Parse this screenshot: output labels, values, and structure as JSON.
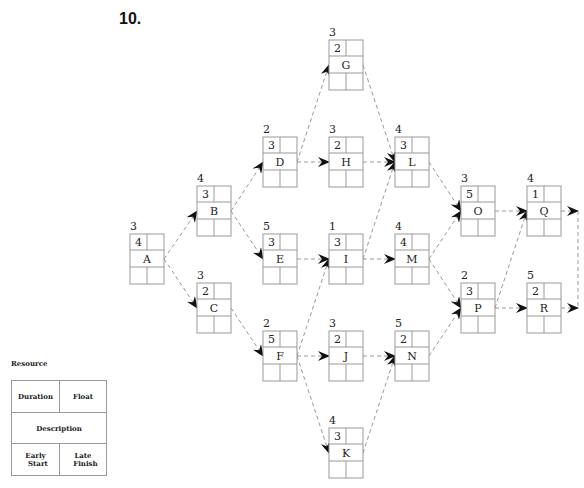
{
  "problem_number": "10.",
  "legend": {
    "title": "Resource",
    "duration": "Duration",
    "float": "Float",
    "description": "Description",
    "early_start": [
      "Early",
      "Start"
    ],
    "late_finish": [
      "Late",
      "Finish"
    ]
  },
  "activities": [
    {
      "id": "A",
      "resource": "3",
      "duration": "4",
      "float": "",
      "early_start": "",
      "late_finish": ""
    },
    {
      "id": "B",
      "resource": "4",
      "duration": "3",
      "float": "",
      "early_start": "",
      "late_finish": ""
    },
    {
      "id": "C",
      "resource": "3",
      "duration": "2",
      "float": "",
      "early_start": "",
      "late_finish": ""
    },
    {
      "id": "D",
      "resource": "2",
      "duration": "3",
      "float": "",
      "early_start": "",
      "late_finish": ""
    },
    {
      "id": "E",
      "resource": "5",
      "duration": "3",
      "float": "",
      "early_start": "",
      "late_finish": ""
    },
    {
      "id": "F",
      "resource": "2",
      "duration": "5",
      "float": "",
      "early_start": "",
      "late_finish": ""
    },
    {
      "id": "G",
      "resource": "3",
      "duration": "2",
      "float": "",
      "early_start": "",
      "late_finish": ""
    },
    {
      "id": "H",
      "resource": "3",
      "duration": "2",
      "float": "",
      "early_start": "",
      "late_finish": ""
    },
    {
      "id": "I",
      "resource": "1",
      "duration": "3",
      "float": "",
      "early_start": "",
      "late_finish": ""
    },
    {
      "id": "J",
      "resource": "3",
      "duration": "2",
      "float": "",
      "early_start": "",
      "late_finish": ""
    },
    {
      "id": "K",
      "resource": "4",
      "duration": "3",
      "float": "",
      "early_start": "",
      "late_finish": ""
    },
    {
      "id": "L",
      "resource": "4",
      "duration": "3",
      "float": "",
      "early_start": "",
      "late_finish": ""
    },
    {
      "id": "M",
      "resource": "4",
      "duration": "4",
      "float": "",
      "early_start": "",
      "late_finish": ""
    },
    {
      "id": "N",
      "resource": "5",
      "duration": "2",
      "float": "",
      "early_start": "",
      "late_finish": ""
    },
    {
      "id": "O",
      "resource": "3",
      "duration": "5",
      "float": "",
      "early_start": "",
      "late_finish": ""
    },
    {
      "id": "P",
      "resource": "2",
      "duration": "3",
      "float": "",
      "early_start": "",
      "late_finish": ""
    },
    {
      "id": "Q",
      "resource": "4",
      "duration": "1",
      "float": "",
      "early_start": "",
      "late_finish": ""
    },
    {
      "id": "R",
      "resource": "5",
      "duration": "2",
      "float": "",
      "early_start": "",
      "late_finish": ""
    }
  ],
  "dependencies": [
    [
      "A",
      "B"
    ],
    [
      "A",
      "C"
    ],
    [
      "B",
      "D"
    ],
    [
      "B",
      "E"
    ],
    [
      "C",
      "F"
    ],
    [
      "D",
      "G"
    ],
    [
      "D",
      "H"
    ],
    [
      "E",
      "I"
    ],
    [
      "F",
      "I"
    ],
    [
      "F",
      "J"
    ],
    [
      "F",
      "K"
    ],
    [
      "G",
      "L"
    ],
    [
      "H",
      "L"
    ],
    [
      "I",
      "L"
    ],
    [
      "I",
      "M"
    ],
    [
      "J",
      "N"
    ],
    [
      "K",
      "N"
    ],
    [
      "L",
      "O"
    ],
    [
      "M",
      "O"
    ],
    [
      "M",
      "P"
    ],
    [
      "N",
      "P"
    ],
    [
      "O",
      "Q"
    ],
    [
      "P",
      "Q"
    ],
    [
      "P",
      "R"
    ]
  ],
  "end_connector": [
    "Q",
    "R"
  ]
}
